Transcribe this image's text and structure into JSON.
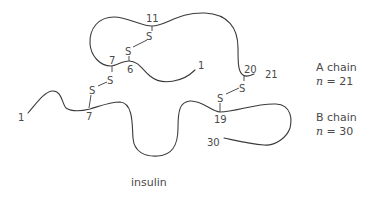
{
  "caption": "insulin",
  "a_chain": {
    "name": "A chain",
    "n_symbol": "n",
    "n_eq": "=",
    "n_value": "21",
    "residue_labels": {
      "start": "1",
      "r6": "6",
      "r7": "7",
      "r11": "11",
      "r20": "20",
      "end": "21"
    }
  },
  "b_chain": {
    "name": "B chain",
    "n_symbol": "n",
    "n_eq": "=",
    "n_value": "30",
    "residue_labels": {
      "start": "1",
      "r7": "7",
      "r19": "19",
      "end": "30"
    }
  },
  "disulfide": {
    "atom": "S",
    "bonds": [
      {
        "between": "A6-A11",
        "atoms": [
          "S",
          "S"
        ]
      },
      {
        "between": "A7-B7",
        "atoms": [
          "S",
          "S"
        ]
      },
      {
        "between": "A20-B19",
        "atoms": [
          "S",
          "S"
        ]
      }
    ]
  },
  "colors": {
    "line": "#3a3a3a",
    "text": "#4a4a4a",
    "background": "#ffffff"
  }
}
